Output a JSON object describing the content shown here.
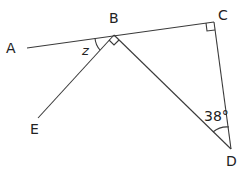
{
  "diagram": {
    "type": "geometry",
    "points": {
      "A": {
        "label": "A"
      },
      "B": {
        "label": "B"
      },
      "C": {
        "label": "C"
      },
      "D": {
        "label": "D"
      },
      "E": {
        "label": "E"
      }
    },
    "segments": [
      "AC (through B)",
      "BE",
      "BD",
      "CD"
    ],
    "angles": {
      "ABE": {
        "label": "z"
      },
      "EBD": {
        "label": "right angle"
      },
      "BCD": {
        "label": "right angle"
      },
      "BDC": {
        "label": "38°"
      }
    }
  }
}
